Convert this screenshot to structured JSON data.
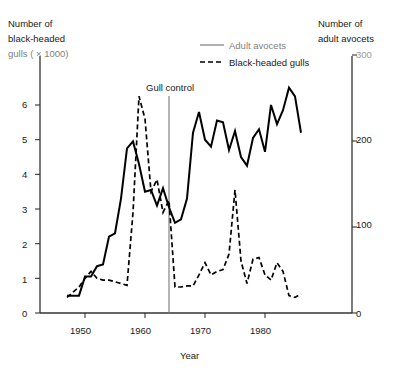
{
  "chart_data": {
    "type": "line",
    "title": "",
    "xlabel": "Year",
    "ylabel_left_lines": [
      "Number of",
      "black-headed",
      "gulls ( × 1000)"
    ],
    "ylabel_right_lines": [
      "Number of",
      "adult avocets"
    ],
    "xlim": [
      1947,
      1986
    ],
    "xticks": [
      1950,
      1960,
      1970,
      1980
    ],
    "xticklabels": [
      "1950",
      "1960",
      "1970",
      "1980"
    ],
    "ylim_left": [
      0,
      6.8
    ],
    "yticks_left": [
      0,
      1,
      2,
      3,
      4,
      5,
      6
    ],
    "yticklabels_left": [
      "0",
      "1",
      "2",
      "3",
      "4",
      "5",
      "6"
    ],
    "ylim_right": [
      0,
      325
    ],
    "yticks_right": [
      0,
      100,
      200,
      300
    ],
    "yticklabels_right": [
      "0",
      "100",
      "200",
      "300"
    ],
    "grid": false,
    "legend_position": "top-center",
    "annotations": [
      {
        "text": "Gull control",
        "x": 1964,
        "label_x": 1957.5,
        "label_y": 6.6
      }
    ],
    "series": [
      {
        "name": "Adult avocets",
        "style": "solid",
        "axis": "right",
        "color": "#000000",
        "x": [
          1947,
          1948,
          1949,
          1950,
          1951,
          1952,
          1953,
          1954,
          1955,
          1956,
          1957,
          1958,
          1959,
          1960,
          1961,
          1962,
          1963,
          1964,
          1965,
          1966,
          1967,
          1968,
          1969,
          1970,
          1971,
          1972,
          1973,
          1974,
          1975,
          1976,
          1977,
          1978,
          1979,
          1980,
          1981,
          1982,
          1983,
          1984,
          1985,
          1986
        ],
        "values_left_units": [
          0.5,
          0.5,
          0.5,
          1.05,
          1.05,
          1.35,
          1.4,
          2.2,
          2.3,
          3.3,
          4.75,
          4.95,
          4.3,
          3.5,
          3.55,
          3.1,
          3.6,
          3.05,
          2.6,
          2.7,
          3.3,
          5.2,
          5.8,
          5.0,
          4.8,
          5.55,
          5.5,
          4.7,
          5.25,
          4.5,
          4.25,
          5.05,
          5.3,
          4.65,
          6.0,
          5.45,
          5.85,
          6.5,
          6.25,
          5.2
        ],
        "values": [
          18,
          18,
          18,
          37,
          37,
          48,
          50,
          78,
          82,
          118,
          170,
          177,
          154,
          125,
          127,
          111,
          129,
          109,
          93,
          97,
          118,
          186,
          208,
          179,
          172,
          199,
          197,
          168,
          188,
          161,
          152,
          181,
          190,
          166,
          215,
          195,
          210,
          233,
          224,
          186
        ]
      },
      {
        "name": "Black-headed gulls",
        "style": "dashed",
        "axis": "left",
        "color": "#000000",
        "x": [
          1947,
          1948,
          1949,
          1950,
          1951,
          1952,
          1953,
          1954,
          1955,
          1956,
          1957,
          1958,
          1959,
          1960,
          1961,
          1962,
          1963,
          1964,
          1965,
          1966,
          1967,
          1968,
          1969,
          1970,
          1971,
          1972,
          1973,
          1974,
          1975,
          1976,
          1977,
          1978,
          1979,
          1980,
          1981,
          1982,
          1983,
          1984,
          1985,
          1986
        ],
        "values": [
          0.45,
          0.6,
          0.75,
          1.0,
          1.2,
          1.0,
          0.95,
          0.95,
          0.9,
          0.85,
          0.8,
          2.9,
          6.25,
          5.6,
          3.5,
          3.85,
          2.9,
          3.25,
          0.75,
          0.75,
          0.78,
          0.78,
          1.1,
          1.45,
          1.1,
          1.2,
          1.25,
          1.7,
          3.55,
          1.5,
          0.85,
          1.55,
          1.6,
          1.1,
          0.95,
          1.45,
          1.2,
          0.5,
          0.45,
          0.55
        ]
      }
    ],
    "legend": [
      {
        "label": "Adult avocets",
        "style": "solid",
        "faded": true
      },
      {
        "label": "Black-headed gulls",
        "style": "dashed",
        "faded": false
      }
    ]
  },
  "labels": {
    "y_left_line1": "Number of",
    "y_left_line2": "black-headed",
    "y_left_line3": "gulls ( × 1000)",
    "y_right_line1": "Number of",
    "y_right_line2": "adult avocets",
    "x_axis": "Year",
    "gull_control": "Gull control",
    "legend_solid": "Adult avocets",
    "legend_dashed": "Black-headed gulls",
    "ytick_6": "6",
    "ytick_5": "5",
    "ytick_4": "4",
    "ytick_3": "3",
    "ytick_2": "2",
    "ytick_1": "1",
    "ytick_0": "0",
    "xtick_1950": "1950",
    "xtick_1960": "1960",
    "xtick_1970": "1970",
    "xtick_1980": "1980",
    "rtick_300": "300",
    "rtick_200": "200",
    "rtick_100": "100",
    "rtick_0": "0"
  },
  "colors": {
    "ink": "#000000",
    "faded_ink": "#7f7f7f",
    "background": "#ffffff"
  }
}
